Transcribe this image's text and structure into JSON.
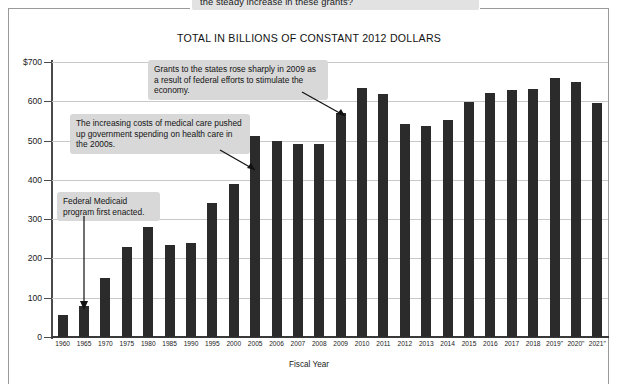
{
  "page": {
    "top_partial_caption": "the steady increase in these grants?"
  },
  "chart_title": "TOTAL IN BILLIONS OF CONSTANT 2012 DOLLARS",
  "xaxis_title": "Fiscal Year",
  "callouts": [
    {
      "id": "callout-2009",
      "text": "Grants to the states rose sharply in 2009 as a result of federal efforts to stimulate the economy."
    },
    {
      "id": "callout-medical",
      "text": "The increasing costs of medical care pushed up government spending on health care in the 2000s."
    },
    {
      "id": "callout-medicaid",
      "text": "Federal Medicaid program first enacted."
    }
  ],
  "colors": {
    "bar": "#2b2b2b",
    "gridline": "#c9c9c9",
    "axis": "#4a4a4a",
    "callout_bg": "#d8d8d8",
    "frame": "#9a9a9a"
  },
  "chart_data": {
    "type": "bar",
    "title": "TOTAL IN BILLIONS OF CONSTANT 2012 DOLLARS",
    "xlabel": "Fiscal Year",
    "ylabel": "",
    "ylim": [
      0,
      700
    ],
    "yticks": [
      0,
      100,
      200,
      300,
      400,
      500,
      600,
      700
    ],
    "ytick_labels": [
      "0",
      "100",
      "200",
      "300",
      "400",
      "500",
      "600",
      "$700"
    ],
    "grid": true,
    "legend": null,
    "categories": [
      "1960",
      "1965",
      "1970",
      "1975",
      "1980",
      "1985",
      "1990",
      "1995",
      "2000",
      "2005",
      "2006",
      "2007",
      "2008",
      "2009",
      "2010",
      "2011",
      "2012",
      "2013",
      "2014",
      "2015",
      "2016",
      "2017",
      "2018",
      "2019\"",
      "2020\"",
      "2021\""
    ],
    "values": [
      55,
      80,
      150,
      230,
      280,
      235,
      240,
      340,
      390,
      512,
      500,
      492,
      492,
      570,
      633,
      618,
      543,
      536,
      553,
      598,
      622,
      628,
      632,
      660,
      648,
      595
    ],
    "annotations": [
      "Grants to the states rose sharply in 2009 as a result of federal efforts to stimulate the economy.",
      "The increasing costs of medical care pushed up government spending on health care in the 2000s.",
      "Federal Medicaid program first enacted."
    ]
  }
}
